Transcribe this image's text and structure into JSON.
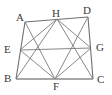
{
  "figure": {
    "canvas": {
      "width": 112,
      "height": 95
    },
    "colors": {
      "outline": "#6f6f6f",
      "base_edge": "#8a8a8a",
      "inner_line": "#7b7b7b",
      "label_text": "#3a3a3a",
      "background": "#ffffff"
    },
    "points": {
      "A": {
        "x": 25,
        "y": 22,
        "label": "A",
        "label_x": 16,
        "label_y": 12
      },
      "B": {
        "x": 16,
        "y": 79,
        "label": "B",
        "label_x": 4,
        "label_y": 73
      },
      "C": {
        "x": 93,
        "y": 79,
        "label": "C",
        "label_x": 97,
        "label_y": 74
      },
      "D": {
        "x": 88,
        "y": 17,
        "label": "D",
        "label_x": 83,
        "label_y": 5
      },
      "E": {
        "x": 20,
        "y": 50,
        "label": "E",
        "label_x": 4,
        "label_y": 44
      },
      "F": {
        "x": 55,
        "y": 79,
        "label": "F",
        "label_x": 53,
        "label_y": 81
      },
      "G": {
        "x": 91,
        "y": 48,
        "label": "G",
        "label_x": 96,
        "label_y": 42
      },
      "H": {
        "x": 57,
        "y": 19,
        "label": "H",
        "label_x": 52,
        "label_y": 8
      }
    },
    "edges": [
      {
        "name": "edge-AD",
        "from": "A",
        "to": "D",
        "style": "outline"
      },
      {
        "name": "edge-AB",
        "from": "A",
        "to": "B",
        "style": "outline"
      },
      {
        "name": "edge-DC",
        "from": "D",
        "to": "C",
        "style": "outline"
      },
      {
        "name": "edge-BC",
        "from": "B",
        "to": "C",
        "style": "base"
      }
    ],
    "inner_segments": [
      {
        "name": "segment-EH",
        "from": "E",
        "to": "H"
      },
      {
        "name": "segment-HG",
        "from": "H",
        "to": "G"
      },
      {
        "name": "segment-GF",
        "from": "G",
        "to": "F"
      },
      {
        "name": "segment-FE",
        "from": "F",
        "to": "E"
      },
      {
        "name": "segment-EG",
        "from": "E",
        "to": "G"
      },
      {
        "name": "segment-HF",
        "from": "H",
        "to": "F"
      },
      {
        "name": "segment-AF",
        "from": "A",
        "to": "F"
      },
      {
        "name": "segment-DF",
        "from": "D",
        "to": "F"
      },
      {
        "name": "segment-BH",
        "from": "B",
        "to": "H"
      },
      {
        "name": "segment-CH",
        "from": "C",
        "to": "H"
      }
    ]
  }
}
